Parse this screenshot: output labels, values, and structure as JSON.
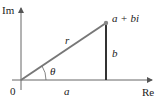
{
  "diagram": {
    "axes": {
      "imaginary_label": "Im",
      "real_label": "Re",
      "origin_label": "0"
    },
    "point_label": "a + bi",
    "segments": {
      "hypotenuse_label": "r",
      "vertical_label": "b",
      "horizontal_label": "a"
    },
    "angle_label": "θ",
    "colors": {
      "axis": "#666666",
      "vector": "#777777",
      "vertical_segment": "#333333",
      "point": "#888888",
      "text": "#222222"
    }
  }
}
